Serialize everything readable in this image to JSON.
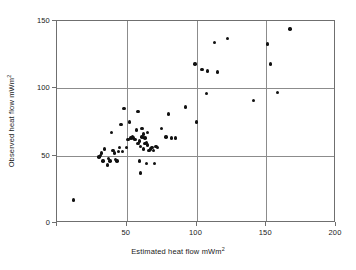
{
  "chart_data": {
    "type": "scatter",
    "title": "",
    "xlabel": "Estimated heat flow mWm",
    "xlabel_sup": "2",
    "ylabel": "Observed heat flow mWm",
    "ylabel_sup": "2",
    "xlim": [
      0,
      200
    ],
    "ylim": [
      0,
      150
    ],
    "xticks": [
      0,
      50,
      100,
      150,
      200
    ],
    "xticklabels": [
      "",
      "50",
      "100",
      "150",
      "200"
    ],
    "yticks": [
      0,
      50,
      100,
      150
    ],
    "yticklabels": [
      "0",
      "50",
      "100",
      "150"
    ],
    "grid": true,
    "gridlines_x": [
      50,
      100,
      150
    ],
    "gridlines_y": [
      50,
      100
    ],
    "legend": null,
    "marker_color": "#111111",
    "frame_color": "#6f6f6f",
    "grid_color": "#8c8c8c",
    "background": "#ffffff",
    "points": [
      [
        12,
        17
      ],
      [
        30,
        49
      ],
      [
        31,
        50
      ],
      [
        32,
        52
      ],
      [
        33,
        46
      ],
      [
        34,
        55
      ],
      [
        36,
        43
      ],
      [
        37,
        48
      ],
      [
        38,
        46
      ],
      [
        39,
        67
      ],
      [
        40,
        54
      ],
      [
        41,
        52
      ],
      [
        42,
        47
      ],
      [
        43,
        46
      ],
      [
        44,
        53
      ],
      [
        45,
        56
      ],
      [
        46,
        73
      ],
      [
        47,
        53
      ],
      [
        48,
        85
      ],
      [
        50,
        56
      ],
      [
        51,
        62
      ],
      [
        52,
        75
      ],
      [
        53,
        63
      ],
      [
        54,
        64
      ],
      [
        55,
        63
      ],
      [
        56,
        62
      ],
      [
        57,
        69
      ],
      [
        58,
        83
      ],
      [
        58,
        59
      ],
      [
        59,
        46
      ],
      [
        59,
        61
      ],
      [
        60,
        57
      ],
      [
        60,
        37
      ],
      [
        61,
        64
      ],
      [
        61,
        70
      ],
      [
        62,
        66
      ],
      [
        62,
        55
      ],
      [
        63,
        63
      ],
      [
        63,
        59
      ],
      [
        64,
        60
      ],
      [
        64,
        44
      ],
      [
        65,
        67
      ],
      [
        65,
        58
      ],
      [
        66,
        54
      ],
      [
        67,
        55
      ],
      [
        68,
        56
      ],
      [
        69,
        54
      ],
      [
        70,
        44
      ],
      [
        71,
        57
      ],
      [
        72,
        56
      ],
      [
        75,
        70
      ],
      [
        78,
        64
      ],
      [
        80,
        81
      ],
      [
        82,
        63
      ],
      [
        85,
        63
      ],
      [
        92,
        86
      ],
      [
        99,
        118
      ],
      [
        100,
        75
      ],
      [
        104,
        114
      ],
      [
        107,
        96
      ],
      [
        108,
        113
      ],
      [
        113,
        134
      ],
      [
        115,
        112
      ],
      [
        122,
        137
      ],
      [
        141,
        91
      ],
      [
        151,
        133
      ],
      [
        153,
        118
      ],
      [
        158,
        97
      ],
      [
        167,
        144
      ]
    ]
  }
}
